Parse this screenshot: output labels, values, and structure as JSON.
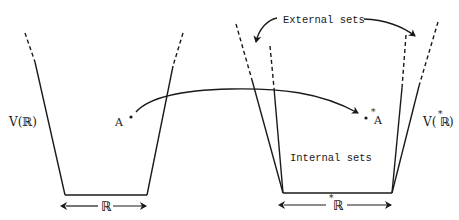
{
  "diagram": {
    "colors": {
      "ink": "#1a1a1a",
      "background": "#ffffff"
    },
    "left_universe": {
      "label": "V(ℝ)",
      "base_label": "ℝ",
      "point_label": "A"
    },
    "right_universe": {
      "label_prefix": "V(",
      "label_star": "*",
      "label_core": "ℝ",
      "label_suffix": ")",
      "base_star": "*",
      "base_label": "ℝ",
      "point_star": "*",
      "point_label": "A",
      "external_sets_label": "External sets",
      "internal_sets_label": "Internal sets"
    },
    "mapping_arrow": {
      "from": "A",
      "to": "*A"
    }
  }
}
